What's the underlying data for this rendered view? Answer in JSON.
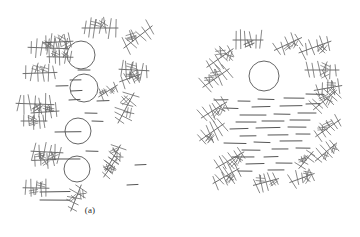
{
  "figure": {
    "title": "",
    "background_color": "#ffffff",
    "width": 360,
    "height": 237,
    "ink_color": "#6b6b6b",
    "dark_ink_color": "#555555",
    "caption_color": "#2b2b2b"
  },
  "panels": [
    {
      "id": "a",
      "caption": "(a)",
      "description": "dispersed random arrangement",
      "origin_x": 0,
      "origin_y": 0
    },
    {
      "id": "b",
      "caption": "(b)",
      "description": "radially organized ring arrangement",
      "origin_x": 180,
      "origin_y": 0
    }
  ],
  "chart_data": {
    "type": "scatter",
    "title": "",
    "xlabel": "",
    "ylabel": "",
    "legend": [],
    "grid": false,
    "panels": [
      {
        "id": "a",
        "label": "(a)",
        "xlim": [
          0,
          180
        ],
        "ylim": [
          0,
          237
        ],
        "circles": [
          {
            "cx": 81,
            "cy": 55,
            "r": 14
          },
          {
            "cx": 84,
            "cy": 88,
            "r": 14
          },
          {
            "cx": 78,
            "cy": 131,
            "r": 13
          },
          {
            "cx": 77,
            "cy": 169,
            "r": 13
          }
        ],
        "dendrites": [
          {
            "cx": 48,
            "cy": 48,
            "len": 40,
            "angle": 2,
            "barbs": 7,
            "barb_len": 8
          },
          {
            "cx": 58,
            "cy": 42,
            "len": 30,
            "angle": -3,
            "barbs": 6,
            "barb_len": 7
          },
          {
            "cx": 60,
            "cy": 57,
            "len": 26,
            "angle": 1,
            "barbs": 5,
            "barb_len": 6
          },
          {
            "cx": 100,
            "cy": 28,
            "len": 36,
            "angle": 0,
            "barbs": 7,
            "barb_len": 8
          },
          {
            "cx": 138,
            "cy": 37,
            "len": 36,
            "angle": -38,
            "barbs": 6,
            "barb_len": 8
          },
          {
            "cx": 40,
            "cy": 73,
            "len": 34,
            "angle": -2,
            "barbs": 6,
            "barb_len": 7
          },
          {
            "cx": 134,
            "cy": 70,
            "len": 30,
            "angle": 3,
            "barbs": 6,
            "barb_len": 8
          },
          {
            "cx": 130,
            "cy": 78,
            "len": 22,
            "angle": -20,
            "barbs": 4,
            "barb_len": 6
          },
          {
            "cx": 35,
            "cy": 104,
            "len": 38,
            "angle": 2,
            "barbs": 7,
            "barb_len": 8
          },
          {
            "cx": 45,
            "cy": 112,
            "len": 28,
            "angle": -4,
            "barbs": 5,
            "barb_len": 7
          },
          {
            "cx": 34,
            "cy": 121,
            "len": 26,
            "angle": 0,
            "barbs": 5,
            "barb_len": 7
          },
          {
            "cx": 108,
            "cy": 91,
            "len": 22,
            "angle": -32,
            "barbs": 4,
            "barb_len": 6
          },
          {
            "cx": 126,
            "cy": 108,
            "len": 34,
            "angle": -62,
            "barbs": 6,
            "barb_len": 8
          },
          {
            "cx": 47,
            "cy": 152,
            "len": 32,
            "angle": 3,
            "barbs": 6,
            "barb_len": 8
          },
          {
            "cx": 44,
            "cy": 160,
            "len": 24,
            "angle": -2,
            "barbs": 4,
            "barb_len": 6
          },
          {
            "cx": 113,
            "cy": 158,
            "len": 30,
            "angle": -60,
            "barbs": 6,
            "barb_len": 7
          },
          {
            "cx": 110,
            "cy": 168,
            "len": 22,
            "angle": -55,
            "barbs": 4,
            "barb_len": 6
          },
          {
            "cx": 36,
            "cy": 188,
            "len": 26,
            "angle": 1,
            "barbs": 5,
            "barb_len": 7
          },
          {
            "cx": 76,
            "cy": 198,
            "len": 28,
            "angle": -68,
            "barbs": 5,
            "barb_len": 7
          }
        ],
        "dashes": [
          {
            "x": 78,
            "y": 70,
            "len": 12
          },
          {
            "x": 70,
            "y": 80,
            "len": 11
          },
          {
            "x": 56,
            "y": 86,
            "len": 12
          },
          {
            "x": 71,
            "y": 91,
            "len": 11
          },
          {
            "x": 69,
            "y": 100,
            "len": 11
          },
          {
            "x": 97,
            "y": 101,
            "len": 12
          },
          {
            "x": 85,
            "y": 113,
            "len": 12
          },
          {
            "x": 55,
            "y": 132,
            "len": 26
          },
          {
            "x": 92,
            "y": 121,
            "len": 11
          },
          {
            "x": 86,
            "y": 151,
            "len": 12
          },
          {
            "x": 50,
            "y": 159,
            "len": 30
          },
          {
            "x": 135,
            "y": 165,
            "len": 11
          },
          {
            "x": 40,
            "y": 192,
            "len": 30
          },
          {
            "x": 40,
            "y": 200,
            "len": 30
          },
          {
            "x": 127,
            "y": 185,
            "len": 11
          }
        ]
      },
      {
        "id": "b",
        "label": "(b)",
        "xlim": [
          0,
          180
        ],
        "ylim": [
          0,
          237
        ],
        "circles": [
          {
            "cx": 84,
            "cy": 76,
            "r": 15
          }
        ],
        "dendrites": [
          {
            "cx": 68,
            "cy": 40,
            "len": 30,
            "angle": 0,
            "barbs": 6,
            "barb_len": 8
          },
          {
            "cx": 108,
            "cy": 44,
            "len": 30,
            "angle": -25,
            "barbs": 5,
            "barb_len": 7
          },
          {
            "cx": 135,
            "cy": 47,
            "len": 34,
            "angle": -20,
            "barbs": 6,
            "barb_len": 7
          },
          {
            "cx": 40,
            "cy": 58,
            "len": 32,
            "angle": -35,
            "barbs": 6,
            "barb_len": 8
          },
          {
            "cx": 36,
            "cy": 78,
            "len": 32,
            "angle": -35,
            "barbs": 6,
            "barb_len": 8
          },
          {
            "cx": 142,
            "cy": 70,
            "len": 34,
            "angle": 0,
            "barbs": 6,
            "barb_len": 7
          },
          {
            "cx": 148,
            "cy": 88,
            "len": 28,
            "angle": -10,
            "barbs": 5,
            "barb_len": 7
          },
          {
            "cx": 145,
            "cy": 100,
            "len": 30,
            "angle": -40,
            "barbs": 6,
            "barb_len": 8
          },
          {
            "cx": 34,
            "cy": 110,
            "len": 30,
            "angle": -32,
            "barbs": 6,
            "barb_len": 8
          },
          {
            "cx": 32,
            "cy": 132,
            "len": 30,
            "angle": -35,
            "barbs": 6,
            "barb_len": 8
          },
          {
            "cx": 148,
            "cy": 128,
            "len": 30,
            "angle": -35,
            "barbs": 6,
            "barb_len": 8
          },
          {
            "cx": 146,
            "cy": 152,
            "len": 28,
            "angle": -40,
            "barbs": 5,
            "barb_len": 7
          },
          {
            "cx": 50,
            "cy": 160,
            "len": 32,
            "angle": -30,
            "barbs": 6,
            "barb_len": 8
          },
          {
            "cx": 46,
            "cy": 176,
            "len": 30,
            "angle": -30,
            "barbs": 6,
            "barb_len": 8
          },
          {
            "cx": 86,
            "cy": 182,
            "len": 26,
            "angle": -15,
            "barbs": 5,
            "barb_len": 7
          },
          {
            "cx": 122,
            "cy": 178,
            "len": 26,
            "angle": -20,
            "barbs": 5,
            "barb_len": 7
          },
          {
            "cx": 126,
            "cy": 160,
            "len": 22,
            "angle": -50,
            "barbs": 4,
            "barb_len": 6
          }
        ],
        "dashes": [
          {
            "x": 34,
            "y": 100,
            "len": 14
          },
          {
            "x": 58,
            "y": 101,
            "len": 12
          },
          {
            "x": 78,
            "y": 99,
            "len": 16
          },
          {
            "x": 104,
            "y": 98,
            "len": 20
          },
          {
            "x": 126,
            "y": 94,
            "len": 18
          },
          {
            "x": 44,
            "y": 108,
            "len": 14
          },
          {
            "x": 72,
            "y": 107,
            "len": 18
          },
          {
            "x": 100,
            "y": 106,
            "len": 22
          },
          {
            "x": 126,
            "y": 104,
            "len": 14
          },
          {
            "x": 60,
            "y": 115,
            "len": 26
          },
          {
            "x": 94,
            "y": 114,
            "len": 16
          },
          {
            "x": 118,
            "y": 113,
            "len": 18
          },
          {
            "x": 56,
            "y": 122,
            "len": 20
          },
          {
            "x": 82,
            "y": 121,
            "len": 22
          },
          {
            "x": 110,
            "y": 120,
            "len": 20
          },
          {
            "x": 50,
            "y": 129,
            "len": 18
          },
          {
            "x": 76,
            "y": 128,
            "len": 24
          },
          {
            "x": 108,
            "y": 127,
            "len": 18
          },
          {
            "x": 60,
            "y": 136,
            "len": 16
          },
          {
            "x": 88,
            "y": 135,
            "len": 20
          },
          {
            "x": 116,
            "y": 134,
            "len": 14
          },
          {
            "x": 44,
            "y": 143,
            "len": 22
          },
          {
            "x": 74,
            "y": 142,
            "len": 16
          },
          {
            "x": 100,
            "y": 141,
            "len": 22
          },
          {
            "x": 62,
            "y": 150,
            "len": 18
          },
          {
            "x": 92,
            "y": 149,
            "len": 16
          },
          {
            "x": 116,
            "y": 148,
            "len": 14
          },
          {
            "x": 52,
            "y": 157,
            "len": 22
          },
          {
            "x": 84,
            "y": 157,
            "len": 14
          },
          {
            "x": 66,
            "y": 164,
            "len": 18
          },
          {
            "x": 96,
            "y": 163,
            "len": 16
          },
          {
            "x": 58,
            "y": 171,
            "len": 14
          },
          {
            "x": 88,
            "y": 170,
            "len": 16
          }
        ]
      }
    ]
  }
}
